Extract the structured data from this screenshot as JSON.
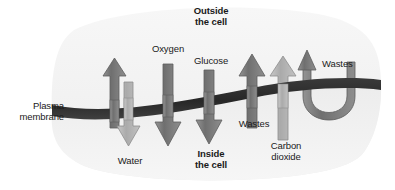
{
  "figure": {
    "title_outside": "Outside\nthe cell",
    "title_inside": "Inside\nthe cell",
    "membrane_label": "Plasma\nmembrane"
  },
  "labels": {
    "water": "Water",
    "oxygen": "Oxygen",
    "glucose": "Glucose",
    "wastes_mid": "Wastes",
    "carbon_dioxide": "Carbon\ndioxide",
    "wastes_right": "Wastes"
  },
  "colors": {
    "background": "#ffffff",
    "cell_fill": "#ebebeb",
    "outside_fill": "#f4f4f4",
    "membrane_dark": "#2e2e2e",
    "arrow_dark": "#7d7d7d",
    "arrow_light": "#b4b4b4",
    "arrow_outline": "#5a5a5a",
    "text": "#1a1a1a"
  },
  "transport_items": [
    {
      "name": "water-out",
      "substance": "Water",
      "direction": "up",
      "tone": "dark"
    },
    {
      "name": "water-in",
      "substance": "Water",
      "direction": "down",
      "tone": "light"
    },
    {
      "name": "oxygen",
      "substance": "Oxygen",
      "direction": "down",
      "tone": "dark"
    },
    {
      "name": "glucose",
      "substance": "Glucose",
      "direction": "down",
      "tone": "dark"
    },
    {
      "name": "wastes",
      "substance": "Wastes",
      "direction": "up",
      "tone": "dark"
    },
    {
      "name": "carbon-dioxide",
      "substance": "Carbon dioxide",
      "direction": "up",
      "tone": "light"
    },
    {
      "name": "wastes-exocytosis",
      "substance": "Wastes",
      "direction": "up-u-turn",
      "tone": "dark"
    }
  ]
}
